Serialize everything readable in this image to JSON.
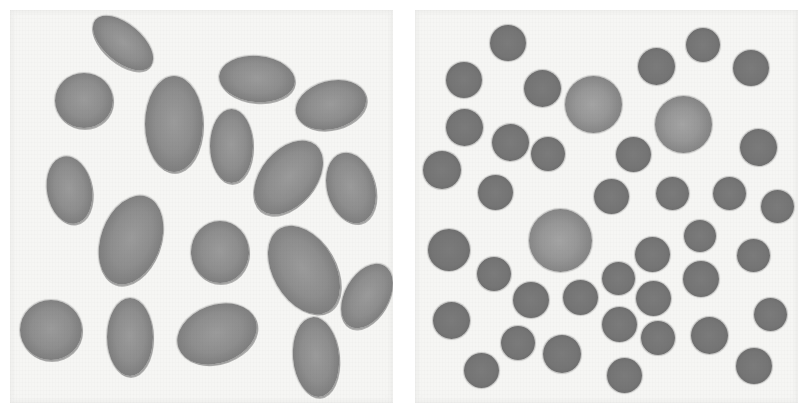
{
  "figure": {
    "colors": {
      "background": "#ffffff",
      "panel": "#f6f6f4",
      "oval_cell": "#8e8e8e",
      "round_cell": "#757575",
      "large_round_cell": "#979797"
    },
    "panels": [
      {
        "id": "left",
        "label": "oval-cells",
        "x": 10,
        "y": 10,
        "width": 383,
        "height": 393,
        "cells": [
          {
            "cx": 123,
            "cy": 43,
            "w": 72,
            "h": 38,
            "rot": 40
          },
          {
            "cx": 84,
            "cy": 100,
            "w": 58,
            "h": 55,
            "rot": 0
          },
          {
            "cx": 174,
            "cy": 124,
            "w": 58,
            "h": 96,
            "rot": 0
          },
          {
            "cx": 257,
            "cy": 79,
            "w": 76,
            "h": 46,
            "rot": 5
          },
          {
            "cx": 331,
            "cy": 105,
            "w": 72,
            "h": 48,
            "rot": -15
          },
          {
            "cx": 231,
            "cy": 146,
            "w": 43,
            "h": 74,
            "rot": 0
          },
          {
            "cx": 69,
            "cy": 190,
            "w": 45,
            "h": 68,
            "rot": -10
          },
          {
            "cx": 288,
            "cy": 177,
            "w": 55,
            "h": 85,
            "rot": 40
          },
          {
            "cx": 351,
            "cy": 188,
            "w": 48,
            "h": 72,
            "rot": -15
          },
          {
            "cx": 131,
            "cy": 240,
            "w": 60,
            "h": 92,
            "rot": 20
          },
          {
            "cx": 220,
            "cy": 252,
            "w": 58,
            "h": 62,
            "rot": 0
          },
          {
            "cx": 304,
            "cy": 270,
            "w": 62,
            "h": 96,
            "rot": -30
          },
          {
            "cx": 367,
            "cy": 296,
            "w": 44,
            "h": 70,
            "rot": 30
          },
          {
            "cx": 51,
            "cy": 330,
            "w": 62,
            "h": 60,
            "rot": 0
          },
          {
            "cx": 130,
            "cy": 337,
            "w": 46,
            "h": 78,
            "rot": 0
          },
          {
            "cx": 217,
            "cy": 334,
            "w": 82,
            "h": 58,
            "rot": -20
          },
          {
            "cx": 316,
            "cy": 357,
            "w": 46,
            "h": 80,
            "rot": -5
          }
        ]
      },
      {
        "id": "right",
        "label": "round-cells",
        "x": 415,
        "y": 10,
        "width": 383,
        "height": 393,
        "cells": [
          {
            "cx": 508,
            "cy": 43,
            "d": 36,
            "type": "round"
          },
          {
            "cx": 464,
            "cy": 80,
            "d": 36,
            "type": "round"
          },
          {
            "cx": 542,
            "cy": 88,
            "d": 37,
            "type": "round"
          },
          {
            "cx": 464,
            "cy": 127,
            "d": 37,
            "type": "round"
          },
          {
            "cx": 510,
            "cy": 142,
            "d": 37,
            "type": "round"
          },
          {
            "cx": 442,
            "cy": 170,
            "d": 38,
            "type": "round"
          },
          {
            "cx": 495,
            "cy": 192,
            "d": 35,
            "type": "round"
          },
          {
            "cx": 548,
            "cy": 154,
            "d": 34,
            "type": "round"
          },
          {
            "cx": 593,
            "cy": 104,
            "d": 57,
            "type": "large"
          },
          {
            "cx": 656,
            "cy": 66,
            "d": 37,
            "type": "round"
          },
          {
            "cx": 703,
            "cy": 45,
            "d": 34,
            "type": "round"
          },
          {
            "cx": 751,
            "cy": 68,
            "d": 36,
            "type": "round"
          },
          {
            "cx": 683,
            "cy": 124,
            "d": 57,
            "type": "large"
          },
          {
            "cx": 633,
            "cy": 154,
            "d": 35,
            "type": "round"
          },
          {
            "cx": 758,
            "cy": 147,
            "d": 37,
            "type": "round"
          },
          {
            "cx": 611,
            "cy": 196,
            "d": 35,
            "type": "round"
          },
          {
            "cx": 672,
            "cy": 193,
            "d": 33,
            "type": "round"
          },
          {
            "cx": 729,
            "cy": 193,
            "d": 33,
            "type": "round"
          },
          {
            "cx": 777,
            "cy": 206,
            "d": 33,
            "type": "round"
          },
          {
            "cx": 560,
            "cy": 240,
            "d": 63,
            "type": "large"
          },
          {
            "cx": 449,
            "cy": 250,
            "d": 42,
            "type": "round"
          },
          {
            "cx": 494,
            "cy": 274,
            "d": 34,
            "type": "round"
          },
          {
            "cx": 531,
            "cy": 300,
            "d": 36,
            "type": "round"
          },
          {
            "cx": 580,
            "cy": 297,
            "d": 35,
            "type": "round"
          },
          {
            "cx": 451,
            "cy": 320,
            "d": 37,
            "type": "round"
          },
          {
            "cx": 518,
            "cy": 343,
            "d": 34,
            "type": "round"
          },
          {
            "cx": 562,
            "cy": 354,
            "d": 38,
            "type": "round"
          },
          {
            "cx": 481,
            "cy": 370,
            "d": 35,
            "type": "round"
          },
          {
            "cx": 700,
            "cy": 236,
            "d": 32,
            "type": "round"
          },
          {
            "cx": 753,
            "cy": 255,
            "d": 33,
            "type": "round"
          },
          {
            "cx": 652,
            "cy": 254,
            "d": 35,
            "type": "round"
          },
          {
            "cx": 618,
            "cy": 278,
            "d": 33,
            "type": "round"
          },
          {
            "cx": 701,
            "cy": 279,
            "d": 36,
            "type": "round"
          },
          {
            "cx": 653,
            "cy": 298,
            "d": 35,
            "type": "round"
          },
          {
            "cx": 619,
            "cy": 324,
            "d": 35,
            "type": "round"
          },
          {
            "cx": 658,
            "cy": 338,
            "d": 34,
            "type": "round"
          },
          {
            "cx": 709,
            "cy": 335,
            "d": 37,
            "type": "round"
          },
          {
            "cx": 770,
            "cy": 314,
            "d": 33,
            "type": "round"
          },
          {
            "cx": 624,
            "cy": 375,
            "d": 35,
            "type": "round"
          },
          {
            "cx": 754,
            "cy": 366,
            "d": 36,
            "type": "round"
          }
        ]
      }
    ]
  }
}
